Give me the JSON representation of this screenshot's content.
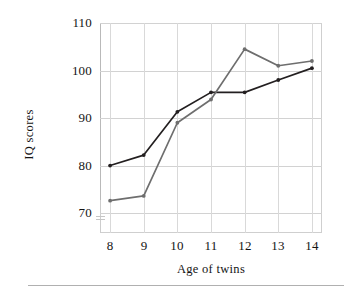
{
  "chart_data": {
    "type": "line",
    "title": "",
    "xlabel": "Age of twins",
    "ylabel": "IQ scores",
    "x": [
      8,
      9,
      10,
      11,
      12,
      13,
      14
    ],
    "xticklabels": [
      "8",
      "9",
      "10",
      "11",
      "12",
      "13",
      "14"
    ],
    "yticklabels": [
      "70",
      "80",
      "90",
      "100",
      "110"
    ],
    "yticks": [
      70,
      80,
      90,
      100,
      110
    ],
    "xlim": [
      7.7,
      14.3
    ],
    "ylim": [
      65.8,
      110
    ],
    "grid": true,
    "legend": "none",
    "series": [
      {
        "name": "series-1",
        "color": "#231f20",
        "marker": "dot",
        "values": [
          80.0,
          82.2,
          91.3,
          95.4,
          95.4,
          98.0,
          100.5
        ]
      },
      {
        "name": "series-2",
        "color": "#6e6e6e",
        "marker": "dot",
        "values": [
          72.6,
          73.6,
          89.0,
          93.9,
          104.5,
          101.0,
          102.0
        ]
      }
    ]
  },
  "axes": {
    "y_title": "IQ scores",
    "x_title": "Age of twins"
  }
}
